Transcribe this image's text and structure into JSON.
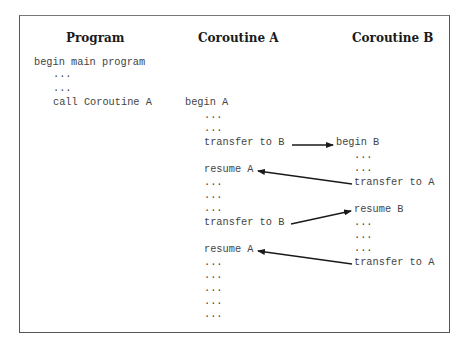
{
  "headers": {
    "program": "Program",
    "coroutine_a": "Coroutine A",
    "coroutine_b": "Coroutine B"
  },
  "program": {
    "lines": [
      "begin main program",
      "...",
      "...",
      "call Coroutine A"
    ]
  },
  "coroutine_a": {
    "lines": [
      "begin A",
      "...",
      "...",
      "transfer to B",
      "resume A",
      "...",
      "...",
      "...",
      "transfer to B",
      "resume A",
      "...",
      "...",
      "...",
      "...",
      "..."
    ]
  },
  "coroutine_b": {
    "lines": [
      "begin B",
      "...",
      "...",
      "transfer to A",
      "resume B",
      "...",
      "...",
      "...",
      "transfer to A"
    ]
  },
  "arrows": [
    {
      "from": "A: transfer to B",
      "to": "B: begin B"
    },
    {
      "from": "B: transfer to A",
      "to": "A: resume A"
    },
    {
      "from": "A: transfer to B",
      "to": "B: resume B"
    },
    {
      "from": "B: transfer to A",
      "to": "A: resume A"
    }
  ]
}
